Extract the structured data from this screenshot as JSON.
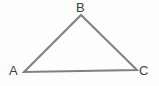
{
  "figure": {
    "name": "triangle-diagram",
    "shape": "triangle",
    "background_color": "#fdfdfd",
    "stroke_color": "#808080",
    "stroke_width": 2,
    "label_color": "#3f3f3f",
    "vertices": [
      {
        "id": "A",
        "label": "A",
        "x": 24,
        "y": 72,
        "label_x": 9,
        "label_y": 64
      },
      {
        "id": "B",
        "label": "B",
        "x": 81,
        "y": 15,
        "label_x": 76,
        "label_y": 1
      },
      {
        "id": "C",
        "label": "C",
        "x": 137,
        "y": 70,
        "label_x": 139,
        "label_y": 64
      }
    ],
    "edges": [
      {
        "id": "AB",
        "from": "A",
        "to": "B"
      },
      {
        "id": "BC",
        "from": "B",
        "to": "C"
      },
      {
        "id": "CA",
        "from": "C",
        "to": "A"
      }
    ],
    "polygon_points": "24,72 81,15 137,70"
  }
}
